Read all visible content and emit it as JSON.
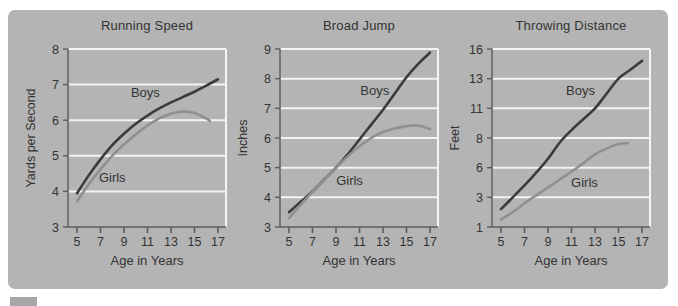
{
  "colors": {
    "panel": "#b4b4b4",
    "gridline": "#f4f4f4",
    "axis": "#5c5c5c",
    "text": "#333333",
    "boys": "#3b3b3b",
    "girls": "#909090",
    "chip": "#a6a6a6"
  },
  "chart_data": [
    {
      "type": "line",
      "title": "Running Speed",
      "xlabel": "Age in Years",
      "ylabel": "Yards per Second",
      "x_ticks": [
        5,
        7,
        9,
        11,
        13,
        15,
        17
      ],
      "y_ticks": [
        3,
        4,
        5,
        6,
        7,
        8
      ],
      "xlim": [
        5,
        17
      ],
      "ylim": [
        3,
        8
      ],
      "grid": "horizontal-white",
      "series": [
        {
          "name": "Boys",
          "color": "boys",
          "label_pos": {
            "fx": 0.49,
            "fy": 0.27
          },
          "x": [
            5,
            6,
            7,
            8,
            9,
            10,
            11,
            12,
            13,
            14,
            15,
            16,
            17
          ],
          "y": [
            3.95,
            4.45,
            4.9,
            5.3,
            5.62,
            5.9,
            6.13,
            6.33,
            6.5,
            6.65,
            6.8,
            6.97,
            7.15
          ]
        },
        {
          "name": "Girls",
          "color": "girls",
          "label_pos": {
            "fx": 0.28,
            "fy": 0.745
          },
          "x": [
            5,
            6,
            7,
            8,
            9,
            10,
            11,
            12,
            13,
            14,
            15,
            16,
            16.3
          ],
          "y": [
            3.72,
            4.2,
            4.62,
            5.0,
            5.32,
            5.6,
            5.85,
            6.05,
            6.18,
            6.24,
            6.2,
            6.05,
            5.98
          ]
        }
      ]
    },
    {
      "type": "line",
      "title": "Broad Jump",
      "xlabel": "Age in Years",
      "ylabel": "Inches",
      "x_ticks": [
        5,
        7,
        9,
        11,
        13,
        15,
        17
      ],
      "y_ticks": [
        3,
        4,
        5,
        6,
        7,
        8,
        9
      ],
      "xlim": [
        5,
        17
      ],
      "ylim": [
        3,
        9
      ],
      "grid": "horizontal-white",
      "series": [
        {
          "name": "Boys",
          "color": "boys",
          "label_pos": {
            "fx": 0.6,
            "fy": 0.26
          },
          "x": [
            5,
            6,
            7,
            8,
            9,
            10,
            11,
            12,
            13,
            14,
            15,
            16,
            17
          ],
          "y": [
            3.5,
            3.85,
            4.2,
            4.6,
            5.0,
            5.45,
            5.95,
            6.45,
            6.95,
            7.5,
            8.05,
            8.5,
            8.88
          ]
        },
        {
          "name": "Girls",
          "color": "girls",
          "label_pos": {
            "fx": 0.44,
            "fy": 0.765
          },
          "x": [
            5,
            6,
            7,
            8,
            9,
            10,
            11,
            12,
            13,
            14,
            15,
            16,
            17
          ],
          "y": [
            3.3,
            3.75,
            4.18,
            4.6,
            5.0,
            5.38,
            5.72,
            6.0,
            6.2,
            6.32,
            6.4,
            6.42,
            6.3
          ]
        }
      ]
    },
    {
      "type": "line",
      "title": "Throwing Distance",
      "xlabel": "Age in Years",
      "ylabel": "Feet",
      "x_ticks": [
        5,
        7,
        9,
        11,
        13,
        15,
        17
      ],
      "y_ticks": [
        1,
        3,
        6,
        8,
        11,
        13,
        16
      ],
      "xlim": [
        5,
        17
      ],
      "ylim": [
        1,
        16
      ],
      "grid": "horizontal-white",
      "series": [
        {
          "name": "Boys",
          "color": "boys",
          "label_pos": {
            "fx": 0.56,
            "fy": 0.257
          },
          "x": [
            5,
            6,
            7,
            8,
            9,
            10,
            11,
            12,
            13,
            14,
            15,
            16,
            17
          ],
          "y": [
            2.2,
            3.0,
            4.2,
            5.5,
            6.6,
            7.7,
            8.8,
            9.9,
            11.0,
            12.0,
            13.0,
            13.9,
            14.8
          ]
        },
        {
          "name": "Girls",
          "color": "girls",
          "label_pos": {
            "fx": 0.585,
            "fy": 0.776
          },
          "x": [
            5,
            6,
            7,
            8,
            9,
            10,
            11,
            12,
            13,
            14,
            15,
            15.8
          ],
          "y": [
            1.5,
            2.0,
            2.6,
            3.2,
            4.0,
            4.8,
            5.6,
            6.3,
            6.9,
            7.3,
            7.6,
            7.65
          ]
        }
      ]
    }
  ]
}
